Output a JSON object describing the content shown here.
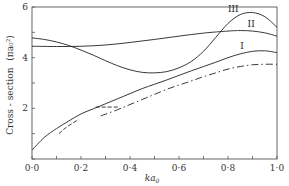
{
  "chart_data": {
    "type": "line",
    "title": "",
    "xlabel": "ka0",
    "xlabel_display": "ka",
    "xlabel_subscript": "0",
    "ylabel": "Cross - section (πa0²)",
    "ylabel_display": "Cross - section",
    "ylabel_unit": "(πa₀²)",
    "xlim": [
      0.0,
      1.0
    ],
    "ylim": [
      0,
      6
    ],
    "x_ticks": [
      0.0,
      0.1,
      0.2,
      0.3,
      0.4,
      0.5,
      0.6,
      0.7,
      0.8,
      0.9,
      1.0
    ],
    "x_tick_labels": [
      "0·0",
      "0·2",
      "0·4",
      "0·6",
      "0·8",
      "1·0"
    ],
    "x_tick_label_values": [
      0.0,
      0.2,
      0.4,
      0.6,
      0.8,
      1.0
    ],
    "y_ticks": [
      0,
      1,
      2,
      3,
      4,
      5,
      6
    ],
    "y_tick_labels": [
      "2",
      "4",
      "6"
    ],
    "y_tick_label_values": [
      2,
      4,
      6
    ],
    "grid": false,
    "legend": "inline curve labels",
    "series": [
      {
        "name": "I",
        "style": "solid",
        "x": [
          0.0,
          0.05,
          0.1,
          0.15,
          0.2,
          0.25,
          0.3,
          0.35,
          0.4,
          0.45,
          0.5,
          0.55,
          0.6,
          0.65,
          0.7,
          0.75,
          0.8,
          0.85,
          0.9,
          0.95,
          1.0
        ],
        "y": [
          0.35,
          0.85,
          1.2,
          1.5,
          1.78,
          1.98,
          2.18,
          2.38,
          2.58,
          2.78,
          2.95,
          3.12,
          3.3,
          3.48,
          3.65,
          3.82,
          4.0,
          4.15,
          4.25,
          4.27,
          4.2
        ],
        "label_pos": [
          0.85,
          4.35
        ]
      },
      {
        "name": "II",
        "style": "solid",
        "x": [
          0.0,
          0.1,
          0.2,
          0.3,
          0.4,
          0.5,
          0.6,
          0.7,
          0.8,
          0.85,
          0.9,
          0.95,
          1.0
        ],
        "y": [
          4.45,
          4.44,
          4.45,
          4.5,
          4.6,
          4.72,
          4.85,
          4.97,
          5.05,
          5.07,
          5.05,
          4.98,
          4.85
        ],
        "label_pos": [
          0.88,
          5.2
        ]
      },
      {
        "name": "III",
        "style": "solid",
        "x": [
          0.0,
          0.05,
          0.1,
          0.15,
          0.2,
          0.25,
          0.3,
          0.35,
          0.4,
          0.45,
          0.5,
          0.55,
          0.6,
          0.65,
          0.7,
          0.75,
          0.8,
          0.85,
          0.9,
          0.95,
          1.0
        ],
        "y": [
          4.78,
          4.72,
          4.62,
          4.48,
          4.3,
          4.1,
          3.88,
          3.68,
          3.52,
          3.42,
          3.4,
          3.45,
          3.6,
          3.85,
          4.25,
          4.8,
          5.35,
          5.7,
          5.78,
          5.62,
          5.2
        ],
        "label_pos": [
          0.8,
          5.8
        ]
      },
      {
        "name": "dash-dot",
        "style": "dash-dot",
        "x": [
          0.28,
          0.35,
          0.4,
          0.45,
          0.5,
          0.55,
          0.6,
          0.65,
          0.7,
          0.75,
          0.8,
          0.85,
          0.9,
          0.95,
          1.0
        ],
        "y": [
          1.7,
          1.95,
          2.15,
          2.35,
          2.55,
          2.75,
          2.92,
          3.08,
          3.25,
          3.4,
          3.55,
          3.65,
          3.72,
          3.74,
          3.74
        ]
      },
      {
        "name": "dashed-low",
        "style": "dashed",
        "x": [
          0.11,
          0.14,
          0.18,
          0.19
        ],
        "y": [
          1.0,
          1.25,
          1.5,
          1.58
        ]
      },
      {
        "name": "dashed-step",
        "style": "dashed",
        "x": [
          0.26,
          0.3,
          0.35
        ],
        "y": [
          2.05,
          2.05,
          2.05
        ]
      }
    ]
  }
}
